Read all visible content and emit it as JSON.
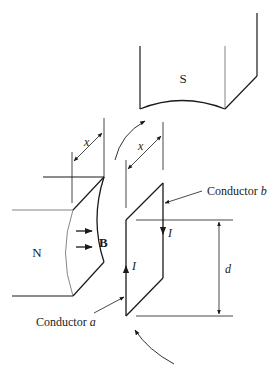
{
  "diagram": {
    "poles": {
      "south": {
        "label": "S"
      },
      "north": {
        "label": "N"
      }
    },
    "field": {
      "label": "B"
    },
    "dimensions": {
      "gap_left": {
        "label": "x"
      },
      "gap_right": {
        "label": "x"
      },
      "loop_height": {
        "label": "d"
      }
    },
    "conductors": {
      "a": {
        "label_prefix": "Conductor ",
        "label_var": "a"
      },
      "b": {
        "label_prefix": "Conductor ",
        "label_var": "b"
      }
    },
    "current": {
      "label_a": "I",
      "label_b": "I"
    },
    "colors": {
      "line": "#1a1a1a",
      "thin": "#555555",
      "background": "#ffffff"
    }
  }
}
